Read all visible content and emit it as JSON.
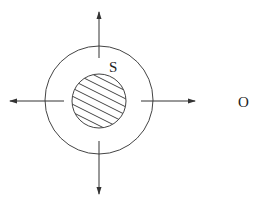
{
  "diagram": {
    "type": "radial-emission-diagram",
    "labels": {
      "source": "S",
      "observer": "O"
    },
    "elements": {
      "inner_body": {
        "shape": "circle",
        "fill": "hatched",
        "description": "hatched sphere (source)"
      },
      "outer_shell": {
        "shape": "circle",
        "fill": "none"
      },
      "arrows": [
        "up",
        "down",
        "left",
        "right"
      ]
    },
    "colors": {
      "stroke": "#333333",
      "background": "#ffffff"
    }
  }
}
